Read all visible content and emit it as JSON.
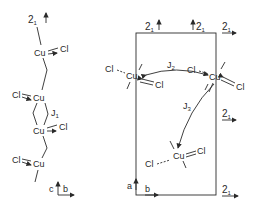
{
  "left_chain": {
    "screw_axis_top": "2",
    "screw_axis_sub": "1",
    "atoms": [
      {
        "cu": "Cu",
        "cl": "Cl"
      },
      {
        "cu": "Cu",
        "cl": "Cl"
      },
      {
        "cu": "Cu",
        "cl": "Cl"
      },
      {
        "cu": "Cu",
        "cl": "Cl"
      }
    ],
    "coupling_label": "J",
    "coupling_sub": "1",
    "axes": {
      "vertical": "c",
      "horizontal": "b"
    }
  },
  "right_cell": {
    "screw_axes": [
      {
        "main": "2",
        "sub": "1"
      },
      {
        "main": "2",
        "sub": "1"
      },
      {
        "main": "2",
        "sub": "1"
      },
      {
        "main": "2",
        "sub": "1"
      },
      {
        "main": "2",
        "sub": "1"
      }
    ],
    "atoms": [
      {
        "cu": "Cu",
        "cl1": "Cl",
        "cl2": "Cl"
      },
      {
        "cu": "Cu",
        "cl1": "Cl",
        "cl2": "Cl"
      },
      {
        "cu": "Cu",
        "cl1": "Cl",
        "cl2": "Cl"
      }
    ],
    "couplings": [
      {
        "label": "J",
        "sub": "2"
      },
      {
        "label": "J",
        "sub": "3"
      }
    ],
    "axes": {
      "vertical": "a",
      "horizontal": "b"
    }
  },
  "colors": {
    "ink": "#2a2a2a",
    "background": "#ffffff"
  }
}
